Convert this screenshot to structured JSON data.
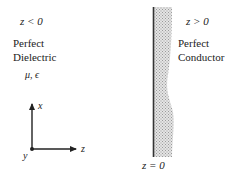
{
  "diagram": {
    "left_region": {
      "condition": "z < 0",
      "material_line1": "Perfect",
      "material_line2": "Dielectric",
      "params": "μ, ϵ"
    },
    "right_region": {
      "condition": "z > 0",
      "material_line1": "Perfect",
      "material_line2": "Conductor"
    },
    "boundary": {
      "label": "z = 0"
    },
    "axes": {
      "x_label": "x",
      "y_label": "y",
      "z_label": "z"
    },
    "colors": {
      "ink": "#222222",
      "conductor_fill": "#c8c8c8",
      "boundary_line": "#333333"
    }
  }
}
